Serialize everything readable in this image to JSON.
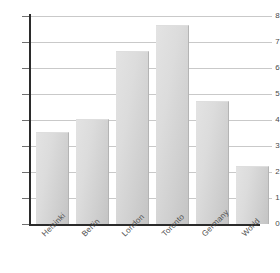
{
  "chart_data": {
    "type": "bar",
    "title": "",
    "xlabel": "",
    "ylabel": "",
    "categories": [
      "Helsinki",
      "Berlin",
      "London",
      "Toronto",
      "Germany",
      "World"
    ],
    "values": [
      3.5,
      4.0,
      6.6,
      7.6,
      4.7,
      2.2
    ],
    "ylim": [
      0,
      8
    ],
    "yticks": [
      0,
      1,
      2,
      3,
      4,
      5,
      6,
      7,
      8
    ],
    "ytick_labels": [
      "0",
      "1",
      "2",
      "3",
      "4",
      "5",
      "6",
      "7",
      "8"
    ],
    "grid": true,
    "legend": false,
    "bar_color": "#d6d6d6",
    "bar_edge_color": "#b4b4b4",
    "grid_color": "#c9c9c9",
    "axis_color": "#2b2b2b",
    "background_color": "#ffffff",
    "xtick_label_rotation": -45
  }
}
